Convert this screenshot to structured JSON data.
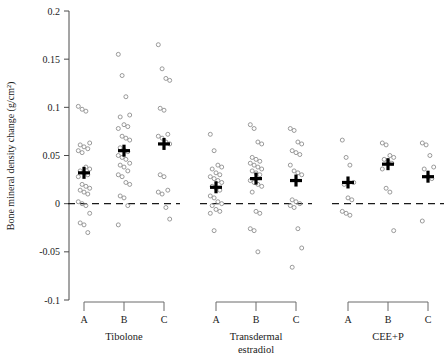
{
  "chart_data": {
    "type": "scatter",
    "title": "",
    "xlabel": "",
    "ylabel": "Bone mineral density change (g/cm²)",
    "ylim": [
      -0.1,
      0.2
    ],
    "grid": false,
    "legend": "none",
    "reference_line": 0,
    "ytick_labels": [
      "0.2",
      "0.15",
      "0.1",
      "0.05",
      "0",
      "-0.05",
      "-0.1"
    ],
    "ytick_values": [
      0.2,
      0.15,
      0.1,
      0.05,
      0,
      -0.05,
      -0.1
    ],
    "groups": [
      {
        "name": "Tibolone",
        "label": "Tibolone",
        "subgroups": [
          {
            "label": "A",
            "mean": 0.032,
            "values": [
              0.101,
              0.098,
              0.096,
              0.063,
              0.061,
              0.059,
              0.057,
              0.055,
              0.053,
              0.038,
              0.036,
              0.034,
              0.032,
              0.03,
              0.028,
              0.02,
              0.018,
              0.016,
              0.014,
              0.012,
              0.01,
              0.002,
              0.0,
              -0.002,
              -0.01,
              -0.02,
              -0.022,
              -0.03
            ]
          },
          {
            "label": "B",
            "mean": 0.055,
            "values": [
              0.155,
              0.133,
              0.111,
              0.092,
              0.09,
              0.082,
              0.08,
              0.078,
              0.07,
              0.068,
              0.066,
              0.058,
              0.056,
              0.054,
              0.05,
              0.048,
              0.046,
              0.042,
              0.04,
              0.038,
              0.034,
              0.03,
              0.028,
              0.022,
              0.02,
              0.008,
              0.006,
              -0.002,
              -0.022
            ]
          },
          {
            "label": "C",
            "mean": 0.062,
            "values": [
              0.165,
              0.14,
              0.13,
              0.128,
              0.099,
              0.097,
              0.072,
              0.07,
              0.068,
              0.064,
              0.062,
              0.03,
              0.028,
              0.014,
              0.012,
              0.01,
              -0.004,
              -0.016
            ]
          }
        ]
      },
      {
        "name": "Transdermal estradiol",
        "label": "Transdermal\nestradiol",
        "label_line1": "Transdermal",
        "label_line2": "estradiol",
        "subgroups": [
          {
            "label": "A",
            "mean": 0.017,
            "values": [
              0.072,
              0.055,
              0.04,
              0.038,
              0.036,
              0.032,
              0.03,
              0.028,
              0.026,
              0.024,
              0.022,
              0.018,
              0.016,
              0.014,
              0.008,
              0.006,
              0.002,
              0.0,
              -0.002,
              -0.006,
              -0.008,
              -0.01,
              -0.028
            ]
          },
          {
            "label": "B",
            "mean": 0.026,
            "values": [
              0.082,
              0.078,
              0.064,
              0.062,
              0.048,
              0.046,
              0.044,
              0.042,
              0.04,
              0.038,
              0.036,
              0.034,
              0.032,
              0.03,
              0.024,
              0.022,
              0.02,
              0.018,
              0.012,
              -0.008,
              -0.01,
              -0.026,
              -0.028,
              -0.05
            ]
          },
          {
            "label": "C",
            "mean": 0.024,
            "values": [
              0.078,
              0.076,
              0.064,
              0.062,
              0.055,
              0.053,
              0.051,
              0.04,
              0.034,
              0.032,
              0.03,
              0.004,
              0.002,
              0.0,
              -0.002,
              -0.004,
              -0.026,
              -0.046,
              -0.066
            ]
          }
        ]
      },
      {
        "name": "CEE+P",
        "label": "CEE+P",
        "subgroups": [
          {
            "label": "A",
            "mean": 0.022,
            "values": [
              0.066,
              0.048,
              0.04,
              0.022,
              0.02,
              0.006,
              0.004,
              -0.008,
              -0.01,
              -0.012
            ]
          },
          {
            "label": "B",
            "mean": 0.041,
            "values": [
              0.063,
              0.061,
              0.05,
              0.048,
              0.046,
              0.044,
              0.042,
              0.036,
              0.016,
              0.012,
              -0.028
            ]
          },
          {
            "label": "C",
            "mean": 0.028,
            "values": [
              0.063,
              0.061,
              0.05,
              0.038,
              0.036,
              0.028,
              0.026,
              -0.018
            ]
          }
        ]
      }
    ]
  }
}
